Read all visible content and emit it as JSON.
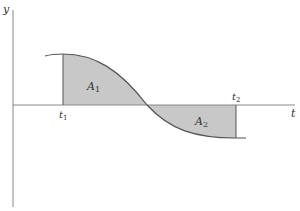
{
  "diagram": {
    "type": "area-under-curve",
    "axes": {
      "vertical_label": "y",
      "horizontal_label": "t"
    },
    "points": {
      "t1": "t",
      "t1_sub": "1",
      "t2": "t",
      "t2_sub": "2"
    },
    "regions": [
      {
        "label": "A",
        "sub": "1",
        "sign": "positive"
      },
      {
        "label": "A",
        "sub": "2",
        "sign": "negative"
      }
    ],
    "colors": {
      "fill": "#c8c8c8",
      "line": "#555555",
      "axis": "#888888"
    }
  }
}
